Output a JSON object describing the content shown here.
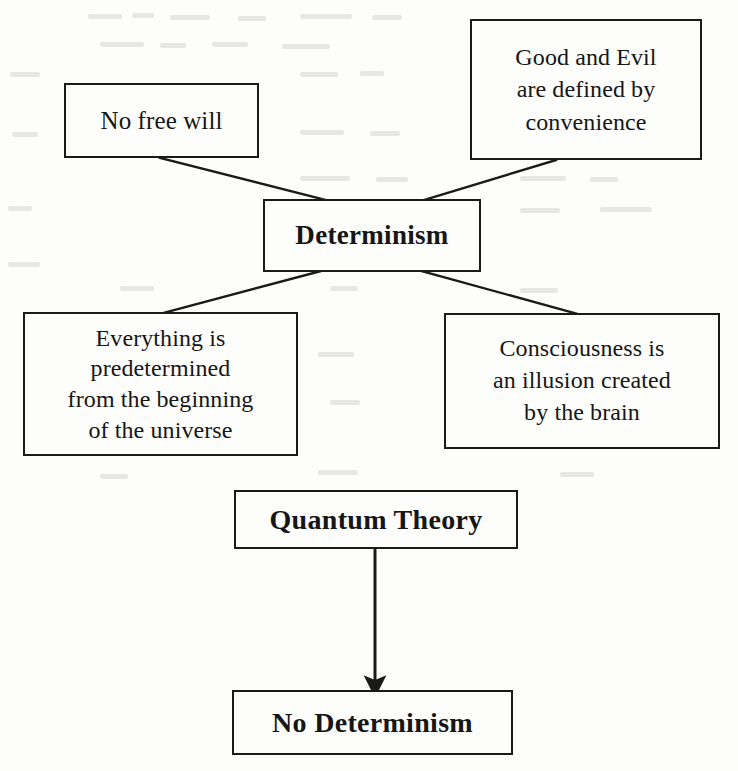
{
  "diagram": {
    "type": "flow-diagram",
    "background_color": "#fdfdfc",
    "line_color": "#1a1a1a",
    "text_color": "#161616",
    "nodes": [
      {
        "id": "no-free-will",
        "label": "No free will",
        "emphasis": "regular"
      },
      {
        "id": "good-and-evil",
        "label": "Good and Evil\nare defined by\nconvenience",
        "emphasis": "regular"
      },
      {
        "id": "determinism",
        "label": "Determinism",
        "emphasis": "bold"
      },
      {
        "id": "everything",
        "label": "Everything is\npredetermined\nfrom the beginning\nof the universe",
        "emphasis": "regular"
      },
      {
        "id": "consciousness",
        "label": "Consciousness is\nan illusion created\nby the brain",
        "emphasis": "regular"
      },
      {
        "id": "quantum-theory",
        "label": "Quantum Theory",
        "emphasis": "bold"
      },
      {
        "id": "no-determinism",
        "label": "No Determinism",
        "emphasis": "bold"
      }
    ],
    "connectors": [
      {
        "id": "no-free-will-to-determinism",
        "from": "no-free-will",
        "to": "determinism",
        "arrow": false
      },
      {
        "id": "good-and-evil-to-determinism",
        "from": "good-and-evil",
        "to": "determinism",
        "arrow": false
      },
      {
        "id": "determinism-to-everything",
        "from": "determinism",
        "to": "everything",
        "arrow": false
      },
      {
        "id": "determinism-to-consciousness",
        "from": "determinism",
        "to": "consciousness",
        "arrow": false
      },
      {
        "id": "quantum-theory-to-no-determinism",
        "from": "quantum-theory",
        "to": "no-determinism",
        "arrow": true
      }
    ]
  }
}
